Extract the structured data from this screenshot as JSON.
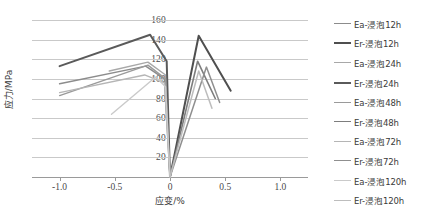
{
  "chart_data": {
    "type": "line",
    "title": "",
    "xlabel": "应变/%",
    "ylabel": "应力/MPa",
    "xlim": [
      -1.25,
      1.25
    ],
    "ylim": [
      0,
      160
    ],
    "xticks": [
      "-1.0",
      "-0.5",
      "0",
      "0.5",
      "1.0"
    ],
    "xtick_values": [
      -1.0,
      -0.5,
      0,
      0.5,
      1.0
    ],
    "yticks": [
      "20",
      "40",
      "60",
      "80",
      "100",
      "120",
      "140",
      "160"
    ],
    "ytick_values": [
      20,
      40,
      60,
      80,
      100,
      120,
      140,
      160
    ],
    "grid": true,
    "legend_position": "right",
    "series": [
      {
        "name": "Ea-浸泡12h",
        "color": "#8c8c8c",
        "width": 1.5,
        "points": [
          [
            -1.0,
            95
          ],
          [
            -0.22,
            113
          ],
          [
            -0.05,
            100
          ],
          [
            0,
            0
          ]
        ]
      },
      {
        "name": "Er-浸泡12h",
        "color": "#4f4f4f",
        "width": 2.0,
        "points": [
          [
            0,
            0
          ],
          [
            0.26,
            144
          ],
          [
            0.55,
            88
          ]
        ]
      },
      {
        "name": "Ea-浸泡24h",
        "color": "#a8a8a8",
        "width": 1.4,
        "points": [
          [
            -0.55,
            108
          ],
          [
            -0.2,
            117
          ],
          [
            -0.04,
            104
          ],
          [
            0,
            0
          ]
        ]
      },
      {
        "name": "Er-浸泡24h",
        "color": "#5a5a5a",
        "width": 2.0,
        "points": [
          [
            -1.0,
            113
          ],
          [
            -0.18,
            145
          ],
          [
            -0.03,
            118
          ],
          [
            0,
            0
          ]
        ]
      },
      {
        "name": "Ea-浸泡48h",
        "color": "#9a9a9a",
        "width": 1.4,
        "points": [
          [
            -1.0,
            83
          ],
          [
            -0.2,
            114
          ],
          [
            -0.04,
            100
          ],
          [
            0,
            0
          ]
        ]
      },
      {
        "name": "Er-浸泡48h",
        "color": "#7d7d7d",
        "width": 1.6,
        "points": [
          [
            0,
            0
          ],
          [
            0.25,
            118
          ],
          [
            0.41,
            80
          ]
        ]
      },
      {
        "name": "Ea-浸泡72h",
        "color": "#b5b5b5",
        "width": 1.4,
        "points": [
          [
            -1.0,
            86
          ],
          [
            -0.23,
            104
          ],
          [
            -0.05,
            96
          ],
          [
            0,
            0
          ]
        ]
      },
      {
        "name": "Er-浸泡72h",
        "color": "#8f8f8f",
        "width": 1.5,
        "points": [
          [
            0,
            0
          ],
          [
            0.33,
            112
          ],
          [
            0.45,
            76
          ]
        ]
      },
      {
        "name": "Ea-浸泡120h",
        "color": "#cacaca",
        "width": 1.4,
        "points": [
          [
            -0.53,
            64
          ],
          [
            -0.13,
            102
          ],
          [
            -0.04,
            92
          ],
          [
            0,
            0
          ]
        ]
      },
      {
        "name": "Er-浸泡120h",
        "color": "#bdbdbd",
        "width": 1.5,
        "points": [
          [
            0,
            0
          ],
          [
            0.26,
            108
          ],
          [
            0.38,
            70
          ]
        ]
      }
    ]
  }
}
